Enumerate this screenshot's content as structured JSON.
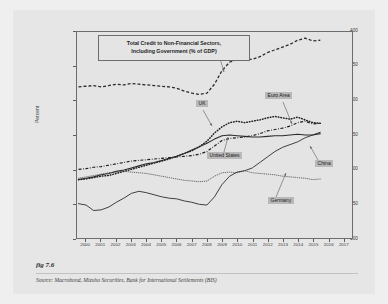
{
  "figure": {
    "caption": "fig 7.6",
    "source": "Source:  Macrobond, Mizuho Securities, Bank for International Settlements (BIS)"
  },
  "chart_data": {
    "type": "line",
    "title": "Total Credit to Non-Financial Sectors, Including Government (% of GDP)",
    "title_line1": "Total Credit to Non-Financial Sectors,",
    "title_line2": "Including Government (% of GDP)",
    "xlabel": "",
    "ylabel": "Percent",
    "xlim": [
      1999.4,
      2017.6
    ],
    "ylim": [
      100,
      400
    ],
    "yticks": [
      100,
      150,
      200,
      250,
      300,
      350,
      400
    ],
    "xticks": [
      2000,
      2001,
      2002,
      2003,
      2004,
      2005,
      2006,
      2007,
      2008,
      2009,
      2010,
      2011,
      2012,
      2013,
      2014,
      2015,
      2016,
      2017
    ],
    "grid": false,
    "legend_position": "inline-annotations",
    "colors": {
      "japan": "#2b2b2b",
      "uk": "#1f1f1f",
      "euro_area": "#1f1f1f",
      "united_states": "#2b2b2b",
      "germany": "#4a4a4a",
      "china": "#2b2b2b",
      "label_background": "#b9b9b9",
      "panel_background": "#e4e4e4",
      "figure_background": "#e6e6e6",
      "page_background": "#efefef",
      "axis": "#6d6d6d"
    },
    "series": [
      {
        "name": "Japan",
        "style": "dashed",
        "label_x": 207,
        "label_y": 41,
        "leader": [
          [
            218,
            52
          ],
          [
            224,
            72
          ]
        ],
        "x": [
          1999.5,
          2000,
          2000.5,
          2001,
          2001.5,
          2002,
          2002.5,
          2003,
          2003.5,
          2004,
          2004.5,
          2005,
          2005.5,
          2006,
          2006.5,
          2007,
          2007.5,
          2008,
          2008.5,
          2009,
          2009.5,
          2010,
          2010.5,
          2011,
          2011.5,
          2012,
          2012.5,
          2013,
          2013.5,
          2014,
          2014.5,
          2015,
          2015.5
        ],
        "y": [
          320,
          321,
          322,
          320,
          322,
          324,
          323,
          325,
          324,
          323,
          322,
          321,
          320,
          318,
          314,
          311,
          309,
          311,
          324,
          344,
          356,
          360,
          361,
          360,
          364,
          370,
          374,
          378,
          382,
          388,
          391,
          387,
          388
        ]
      },
      {
        "name": "UK",
        "style": "dotted",
        "label_x": 196,
        "label_y": 100,
        "leader": [
          [
            203,
            110
          ],
          [
            212,
            126
          ]
        ],
        "x": [
          1999.5,
          2000,
          2000.5,
          2001,
          2001.5,
          2002,
          2002.5,
          2003,
          2003.5,
          2004,
          2004.5,
          2005,
          2005.5,
          2006,
          2006.5,
          2007,
          2007.5,
          2008,
          2008.5,
          2009,
          2009.5,
          2010,
          2010.5,
          2011,
          2011.5,
          2012,
          2012.5,
          2013,
          2013.5,
          2014,
          2014.5,
          2015,
          2015.5
        ],
        "y": [
          185,
          186,
          188,
          190,
          191,
          194,
          197,
          200,
          203,
          206,
          209,
          212,
          215,
          219,
          223,
          227,
          233,
          241,
          253,
          262,
          268,
          270,
          268,
          270,
          272,
          275,
          277,
          275,
          273,
          276,
          272,
          268,
          267
        ]
      },
      {
        "name": "Euro Area",
        "style": "dashdot",
        "label_x": 265,
        "label_y": 92,
        "leader": [
          [
            283,
            102
          ],
          [
            292,
            124
          ]
        ],
        "x": [
          1999.5,
          2000,
          2000.5,
          2001,
          2001.5,
          2002,
          2002.5,
          2003,
          2003.5,
          2004,
          2004.5,
          2005,
          2005.5,
          2006,
          2006.5,
          2007,
          2007.5,
          2008,
          2008.5,
          2009,
          2009.5,
          2010,
          2010.5,
          2011,
          2011.5,
          2012,
          2012.5,
          2013,
          2013.5,
          2014,
          2014.5,
          2015,
          2015.5
        ],
        "y": [
          200,
          201,
          203,
          204,
          206,
          208,
          210,
          212,
          213,
          214,
          215,
          216,
          217,
          218,
          219,
          220,
          222,
          226,
          234,
          242,
          245,
          246,
          247,
          249,
          252,
          256,
          258,
          260,
          263,
          268,
          270,
          266,
          267
        ]
      },
      {
        "name": "United States",
        "style": "solid",
        "label_x": 207,
        "label_y": 152,
        "leader": [
          [
            224,
            152
          ],
          [
            228,
            137
          ]
        ],
        "x": [
          1999.5,
          2000,
          2000.5,
          2001,
          2001.5,
          2002,
          2002.5,
          2003,
          2003.5,
          2004,
          2004.5,
          2005,
          2005.5,
          2006,
          2006.5,
          2007,
          2007.5,
          2008,
          2008.5,
          2009,
          2009.5,
          2010,
          2010.5,
          2011,
          2011.5,
          2012,
          2012.5,
          2013,
          2013.5,
          2014,
          2014.5,
          2015,
          2015.5
        ],
        "y": [
          185,
          187,
          189,
          192,
          194,
          197,
          199,
          202,
          205,
          208,
          210,
          213,
          216,
          219,
          223,
          228,
          233,
          238,
          244,
          249,
          250,
          249,
          248,
          247,
          247,
          248,
          249,
          249,
          250,
          251,
          250,
          250,
          252
        ]
      },
      {
        "name": "Germany",
        "style": "fine-dotted",
        "label_x": 268,
        "label_y": 197,
        "leader": [
          [
            276,
            197
          ],
          [
            286,
            173
          ]
        ],
        "x": [
          1999.5,
          2000,
          2000.5,
          2001,
          2001.5,
          2002,
          2002.5,
          2003,
          2003.5,
          2004,
          2004.5,
          2005,
          2005.5,
          2006,
          2006.5,
          2007,
          2007.5,
          2008,
          2008.5,
          2009,
          2009.5,
          2010,
          2010.5,
          2011,
          2011.5,
          2012,
          2012.5,
          2013,
          2013.5,
          2014,
          2014.5,
          2015,
          2015.5
        ],
        "y": [
          187,
          189,
          191,
          193,
          195,
          196,
          197,
          196,
          195,
          194,
          192,
          190,
          188,
          186,
          184,
          183,
          182,
          183,
          190,
          195,
          196,
          195,
          198,
          195,
          194,
          193,
          192,
          190,
          189,
          188,
          187,
          185,
          186
        ]
      },
      {
        "name": "China",
        "style": "solid-thin",
        "label_x": 315,
        "label_y": 160,
        "leader": [
          [
            318,
            160
          ],
          [
            310,
            146
          ]
        ],
        "x": [
          1999.5,
          2000,
          2000.5,
          2001,
          2001.5,
          2002,
          2002.5,
          2003,
          2003.5,
          2004,
          2004.5,
          2005,
          2005.5,
          2006,
          2006.5,
          2007,
          2007.5,
          2008,
          2008.5,
          2009,
          2009.5,
          2010,
          2010.5,
          2011,
          2011.5,
          2012,
          2012.5,
          2013,
          2013.5,
          2014,
          2014.5,
          2015,
          2015.5
        ],
        "y": [
          150,
          148,
          140,
          141,
          145,
          152,
          158,
          165,
          168,
          166,
          163,
          160,
          158,
          157,
          154,
          152,
          149,
          148,
          160,
          178,
          190,
          196,
          198,
          202,
          210,
          218,
          226,
          232,
          236,
          240,
          246,
          250,
          254
        ]
      }
    ]
  }
}
